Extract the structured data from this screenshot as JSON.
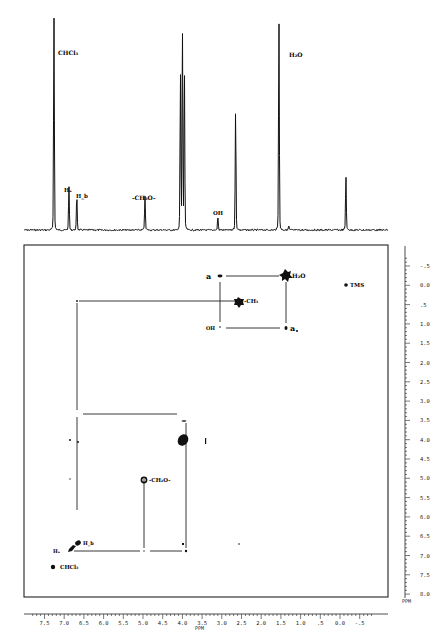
{
  "header": {
    "faint_caption": ""
  },
  "chart_data": [
    {
      "type": "line",
      "title": "1D 1H NMR spectrum",
      "xlabel": "PPM",
      "ylabel": "",
      "x_reversed": true,
      "xlim": [
        7.8,
        -0.8
      ],
      "peaks": [
        {
          "ppm": 7.26,
          "height": 1.0,
          "label": "CHCl3"
        },
        {
          "ppm": 6.88,
          "height": 0.2,
          "label": "Ha"
        },
        {
          "ppm": 6.68,
          "height": 0.16,
          "label": "Hb"
        },
        {
          "ppm": 4.95,
          "height": 0.16,
          "label": "-CH2O-"
        },
        {
          "ppm": 4.05,
          "height": 0.72,
          "label": ""
        },
        {
          "ppm": 4.0,
          "height": 0.93,
          "label": ""
        },
        {
          "ppm": 3.95,
          "height": 0.75,
          "label": ""
        },
        {
          "ppm": 3.1,
          "height": 0.06,
          "label": "OH"
        },
        {
          "ppm": 2.65,
          "height": 0.55,
          "label": ""
        },
        {
          "ppm": 1.55,
          "height": 0.98,
          "label": "H2O"
        },
        {
          "ppm": 1.3,
          "height": 0.02,
          "label": ""
        },
        {
          "ppm": -0.15,
          "height": 0.25,
          "label": ""
        }
      ]
    },
    {
      "type": "scatter",
      "title": "2D COSY contour plot",
      "xlabel": "PPM",
      "ylabel": "PPM",
      "xlim": [
        7.8,
        -0.8
      ],
      "ylim": [
        -0.8,
        8.0
      ],
      "x_ticks": [
        "7.5",
        "7.0",
        "6.5",
        "6.0",
        "5.5",
        "5.0",
        "4.5",
        "4.0",
        "3.5",
        "3.0",
        "2.5",
        "2.0",
        "1.5",
        "1.0",
        ".5",
        "0.0",
        "-.5"
      ],
      "y_ticks": [
        "-.5",
        "0.0",
        ".5",
        "1.0",
        "1.5",
        "2.0",
        "2.5",
        "3.0",
        "3.5",
        "4.0",
        "4.5",
        "5.0",
        "5.5",
        "6.0",
        "6.5",
        "7.0",
        "7.5",
        "8.0"
      ],
      "diagonal_peaks": [
        {
          "ppm": 7.26,
          "label": "CHCl3"
        },
        {
          "ppm": 6.9,
          "label": "Ha"
        },
        {
          "ppm": 6.68,
          "label": "Hb"
        },
        {
          "ppm": 5.0,
          "label": "-CH2O-"
        },
        {
          "ppm": 4.02,
          "label": ""
        },
        {
          "ppm": 2.7,
          "label": "-CH3"
        },
        {
          "ppm": 1.55,
          "label": "H2O"
        },
        {
          "ppm": -0.05,
          "label": "TMS"
        }
      ],
      "cross_peaks": [
        {
          "x": 3.05,
          "y": 1.55,
          "label": "a"
        },
        {
          "x": 1.55,
          "y": 3.05,
          "label": "a"
        },
        {
          "x": 3.05,
          "y": 3.05,
          "label": "OH"
        },
        {
          "x": 6.8,
          "y": 2.7,
          "label": ""
        },
        {
          "x": 6.8,
          "y": 4.02,
          "label": ""
        },
        {
          "x": 4.02,
          "y": 6.9,
          "label": ""
        },
        {
          "x": 5.0,
          "y": 6.9,
          "label": ""
        }
      ]
    }
  ],
  "labels": {
    "top": {
      "chcl3": "CHCl₃",
      "h2o": "H₂O",
      "ha": "Hₐ",
      "hb": "H_b",
      "ch2o": "-CH₂O-",
      "oh": "OH"
    },
    "plot": {
      "tms": "TMS",
      "a1": "a",
      "a2": "a",
      "h2o": "H₂O",
      "ch3": "-CH₃",
      "oh": "OH",
      "ch2o": "-CH₂O-",
      "hb": "H_b",
      "ha": "Hₐ",
      "chcl3": "CHCl₃"
    }
  },
  "axes": {
    "x_unit": "PPM",
    "y_unit": "PPM"
  }
}
